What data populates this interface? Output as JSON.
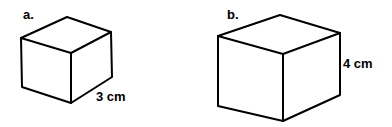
{
  "figures": [
    {
      "id": "a",
      "label": "a.",
      "dimension_label": "3 cm",
      "shape": "cube",
      "edge_length_cm": 3
    },
    {
      "id": "b",
      "label": "b.",
      "dimension_label": "4 cm",
      "shape": "cube",
      "edge_length_cm": 4
    }
  ],
  "colors": {
    "line": "#000000",
    "background": "#ffffff"
  }
}
